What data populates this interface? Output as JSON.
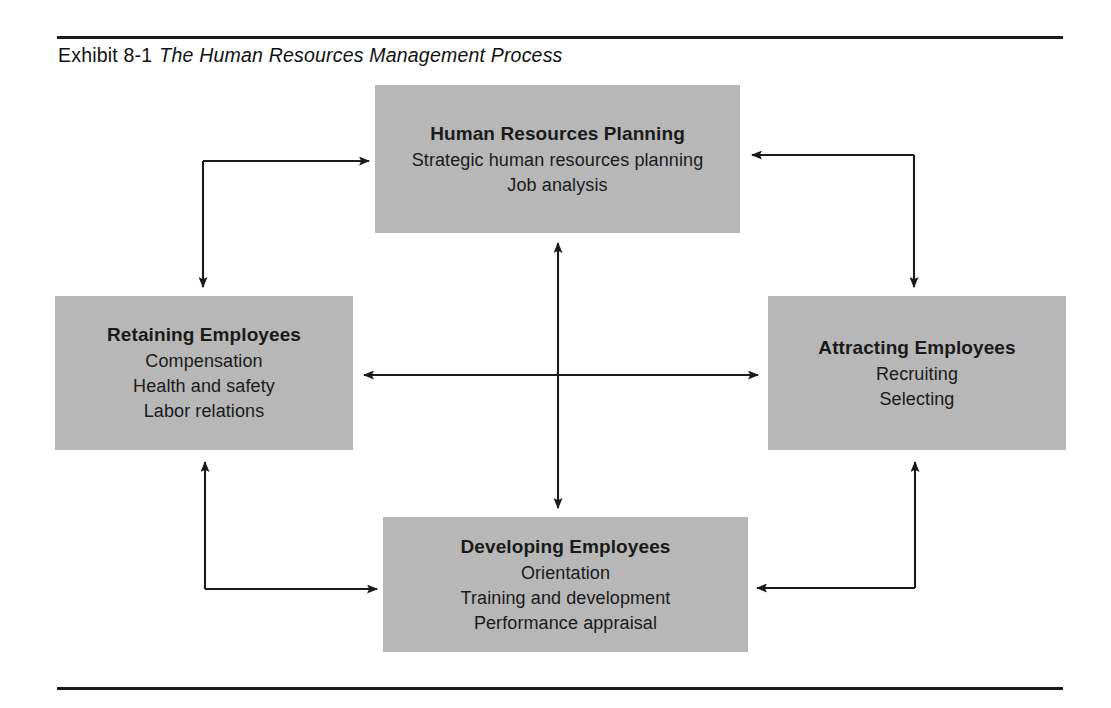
{
  "exhibit": {
    "label": "Exhibit 8-1",
    "title": "The Human Resources Management Process"
  },
  "colors": {
    "box_fill": "#b7b7b7",
    "box_shadow": "#d8d8d8",
    "rule": "#1a1a1a",
    "connector": "#1a1a1a",
    "text": "#1a1a1a",
    "page_background": "#ffffff"
  },
  "diagram": {
    "type": "process-cycle",
    "boxes": [
      {
        "id": "planning",
        "position": "top",
        "title": "Human Resources Planning",
        "items": [
          "Strategic human resources planning",
          "Job analysis"
        ]
      },
      {
        "id": "retaining",
        "position": "left",
        "title": "Retaining Employees",
        "items": [
          "Compensation",
          "Health and safety",
          "Labor relations"
        ]
      },
      {
        "id": "attracting",
        "position": "right",
        "title": "Attracting Employees",
        "items": [
          "Recruiting",
          "Selecting"
        ]
      },
      {
        "id": "developing",
        "position": "bottom",
        "title": "Developing Employees",
        "items": [
          "Orientation",
          "Training and development",
          "Performance appraisal"
        ]
      }
    ],
    "connectors": [
      {
        "id": "planning-retaining",
        "from": "planning",
        "to": "retaining",
        "style": "elbow",
        "heads": "both"
      },
      {
        "id": "attracting-planning",
        "from": "attracting",
        "to": "planning",
        "style": "elbow",
        "heads": "both"
      },
      {
        "id": "retaining-developing",
        "from": "retaining",
        "to": "developing",
        "style": "elbow",
        "heads": "both"
      },
      {
        "id": "developing-attracting",
        "from": "developing",
        "to": "attracting",
        "style": "elbow",
        "heads": "both"
      },
      {
        "id": "planning-developing",
        "from": "planning",
        "to": "developing",
        "style": "straight-vertical",
        "heads": "both"
      },
      {
        "id": "retaining-attracting",
        "from": "retaining",
        "to": "attracting",
        "style": "straight-horizontal",
        "heads": "both"
      }
    ]
  }
}
